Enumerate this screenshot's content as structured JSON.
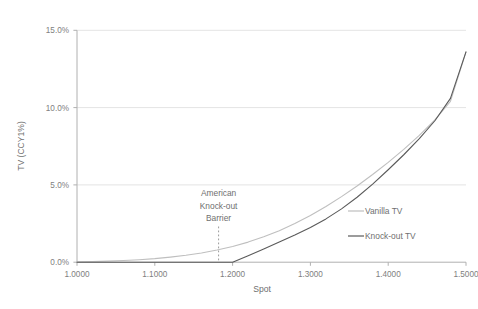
{
  "chart_data": {
    "type": "line",
    "title": "",
    "xlabel": "Spot",
    "ylabel": "TV (CCY1%)",
    "xlim": [
      1.0,
      1.5
    ],
    "ylim": [
      0.0,
      15.0
    ],
    "grid": true,
    "legend_position": "middle-right",
    "x_tick_labels": [
      "1.0000",
      "1.1000",
      "1.2000",
      "1.3000",
      "1.4000",
      "1.5000"
    ],
    "x_ticks": [
      1.0,
      1.1,
      1.2,
      1.3,
      1.4,
      1.5
    ],
    "y_tick_labels": [
      "0.0%",
      "5.0%",
      "10.0%",
      "15.0%"
    ],
    "y_ticks": [
      0.0,
      5.0,
      10.0,
      15.0
    ],
    "annotations": [
      {
        "name": "american-knock-out-barrier",
        "lines": [
          "American",
          "Knock-out",
          "Barrier"
        ],
        "x": 1.2,
        "marker": "vertical-dotted-line"
      }
    ],
    "series": [
      {
        "name": "Vanilla TV",
        "color": "#bfbfbf",
        "x": [
          1.0,
          1.02,
          1.04,
          1.06,
          1.08,
          1.1,
          1.12,
          1.14,
          1.16,
          1.18,
          1.2,
          1.22,
          1.24,
          1.26,
          1.28,
          1.3,
          1.32,
          1.34,
          1.36,
          1.38,
          1.4,
          1.42,
          1.44,
          1.46,
          1.48,
          1.5
        ],
        "values": [
          0.02,
          0.04,
          0.07,
          0.11,
          0.16,
          0.23,
          0.33,
          0.45,
          0.6,
          0.79,
          1.02,
          1.3,
          1.64,
          2.04,
          2.5,
          3.02,
          3.6,
          4.24,
          4.93,
          5.67,
          6.46,
          7.3,
          8.2,
          9.2,
          10.4,
          13.6
        ]
      },
      {
        "name": "Knock-out TV",
        "color": "#5a5a5a",
        "x": [
          1.0,
          1.05,
          1.1,
          1.15,
          1.2,
          1.22,
          1.24,
          1.26,
          1.28,
          1.3,
          1.32,
          1.34,
          1.36,
          1.38,
          1.4,
          1.42,
          1.44,
          1.46,
          1.48,
          1.5
        ],
        "values": [
          0.0,
          0.0,
          0.0,
          0.0,
          0.0,
          0.42,
          0.85,
          1.3,
          1.76,
          2.25,
          2.8,
          3.45,
          4.2,
          5.05,
          5.98,
          6.95,
          8.0,
          9.15,
          10.6,
          13.6
        ]
      }
    ]
  },
  "axes": {
    "y_label": "TV (CCY1%)",
    "x_label": "Spot",
    "y_ticks": [
      "15.0%",
      "10.0%",
      "5.0%",
      "0.0%"
    ],
    "x_ticks": [
      "1.0000",
      "1.1000",
      "1.2000",
      "1.3000",
      "1.4000",
      "1.5000"
    ]
  },
  "annotation": {
    "line1": "American",
    "line2": "Knock-out",
    "line3": "Barrier"
  },
  "legend": {
    "entries": [
      {
        "label": "Vanilla TV",
        "color": "#bfbfbf"
      },
      {
        "label": "Knock-out TV",
        "color": "#5a5a5a"
      }
    ]
  },
  "colors": {
    "vanilla": "#bfbfbf",
    "knockout": "#5a5a5a",
    "grid": "#e4e4e4",
    "axis": "#b0b0b0",
    "text": "#808080",
    "background": "#ffffff"
  }
}
